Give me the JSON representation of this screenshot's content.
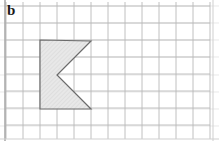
{
  "figure": {
    "label": "b",
    "background_color": "#ffffff"
  },
  "grid": {
    "cell_size": 17,
    "origin_x": 6,
    "origin_y": 6,
    "columns": 12,
    "rows": 8,
    "line_color": "#b9b9b9",
    "minor_line_color": "#d8d8d8",
    "border_color": "#a8a8a8",
    "grid_visible": true
  },
  "shape": {
    "name": "shaded-chevron-polygon",
    "type": "polygon",
    "fill_color": "#e6e6e6",
    "stroke_color": "#6b6b6b",
    "stroke_width": 1.2,
    "vertices_px": [
      [
        40,
        40
      ],
      [
        91,
        41
      ],
      [
        57,
        75
      ],
      [
        91,
        109
      ],
      [
        40,
        109
      ]
    ],
    "vertices_grid": [
      [
        2,
        2
      ],
      [
        5,
        2
      ],
      [
        3,
        4
      ],
      [
        5,
        6
      ],
      [
        2,
        6
      ]
    ],
    "hatch_color": "#d2d2d2"
  },
  "chart_data": {
    "type": "table",
    "title": "b",
    "xlabel": "",
    "ylabel": "",
    "categories": [
      "vertex-1",
      "vertex-2",
      "vertex-3",
      "vertex-4",
      "vertex-5"
    ],
    "values": [
      {
        "x": 2,
        "y": 2
      },
      {
        "x": 5,
        "y": 2
      },
      {
        "x": 3,
        "y": 4
      },
      {
        "x": 5,
        "y": 6
      },
      {
        "x": 2,
        "y": 6
      }
    ],
    "xlim": [
      0,
      12
    ],
    "ylim": [
      0,
      8
    ],
    "grid": true
  }
}
